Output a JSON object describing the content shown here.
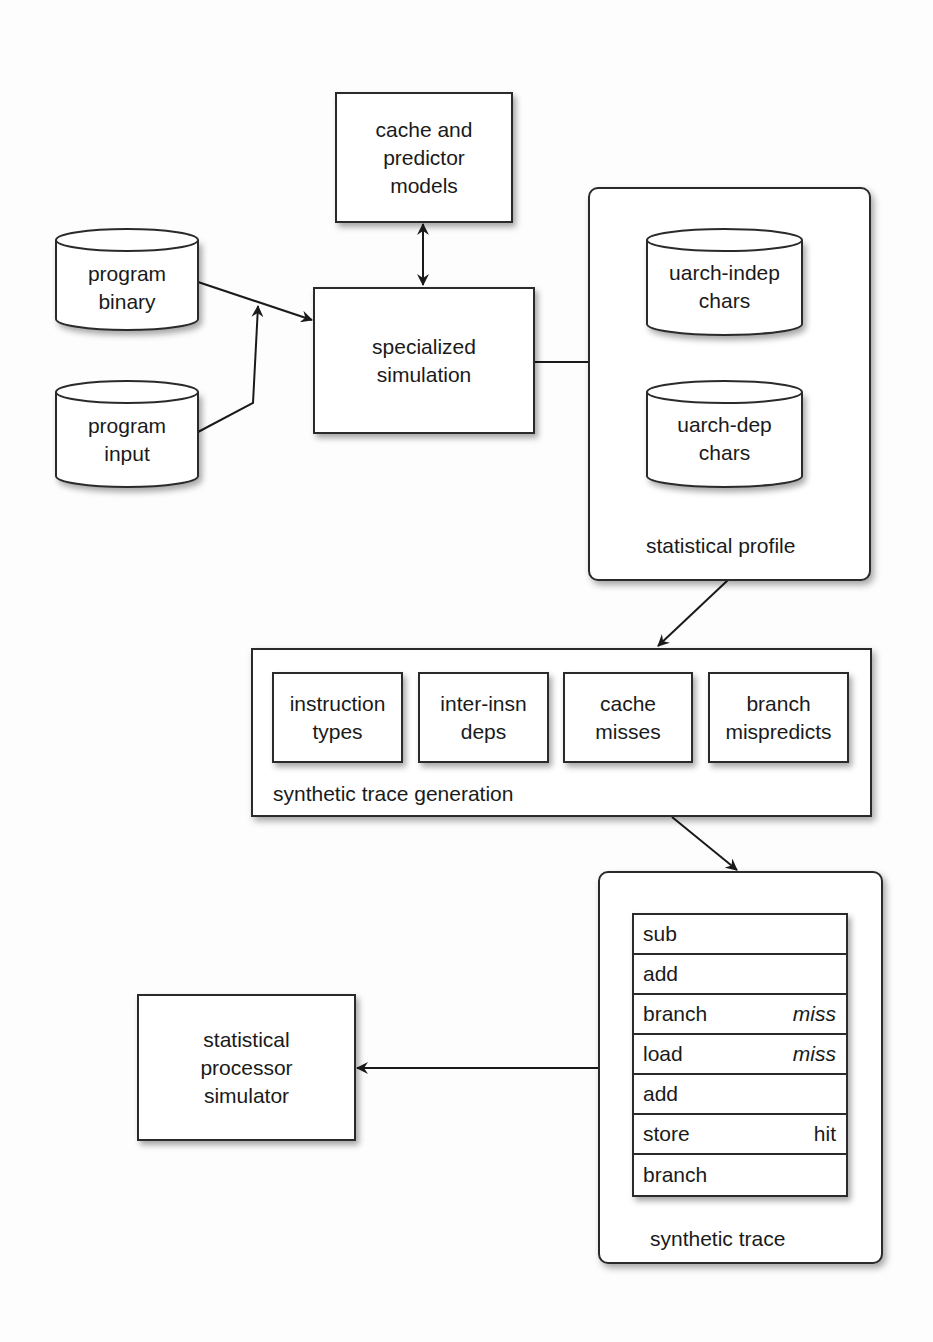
{
  "diagram": {
    "nodes": {
      "cache_predictor": {
        "label": "cache and\npredictor\nmodels"
      },
      "program_binary": {
        "label": "program\nbinary"
      },
      "program_input": {
        "label": "program\ninput"
      },
      "specialized_sim": {
        "label": "specialized\nsimulation"
      },
      "uarch_indep": {
        "label": "uarch-indep\nchars"
      },
      "uarch_dep": {
        "label": "uarch-dep\nchars"
      },
      "stat_proc_sim": {
        "label": "statistical\nprocessor\nsimulator"
      }
    },
    "groups": {
      "statistical_profile": {
        "caption": "statistical profile"
      },
      "trace_generation": {
        "caption": "synthetic trace generation",
        "components": [
          {
            "label": "instruction\ntypes"
          },
          {
            "label": "inter-insn\ndeps"
          },
          {
            "label": "cache\nmisses"
          },
          {
            "label": "branch\nmispredicts"
          }
        ]
      },
      "synthetic_trace": {
        "caption": "synthetic trace",
        "rows": [
          {
            "insn": "sub",
            "status": ""
          },
          {
            "insn": "add",
            "status": ""
          },
          {
            "insn": "branch",
            "status": "miss"
          },
          {
            "insn": "load",
            "status": "miss"
          },
          {
            "insn": "add",
            "status": ""
          },
          {
            "insn": "store",
            "status": "hit"
          },
          {
            "insn": "branch",
            "status": ""
          }
        ]
      }
    },
    "edges": [
      {
        "from": "program binary",
        "to": "specialized simulation"
      },
      {
        "from": "program input",
        "to": "specialized simulation"
      },
      {
        "from": "cache and predictor models",
        "to": "specialized simulation",
        "bidirectional": true
      },
      {
        "from": "specialized simulation",
        "to": "uarch-indep chars"
      },
      {
        "from": "specialized simulation",
        "to": "uarch-dep chars"
      },
      {
        "from": "statistical profile",
        "to": "synthetic trace generation"
      },
      {
        "from": "synthetic trace generation",
        "to": "synthetic trace"
      },
      {
        "from": "synthetic trace",
        "to": "statistical processor simulator"
      }
    ],
    "colors": {
      "stroke": "#2a2a2a",
      "fill": "#ffffff",
      "background": "#fdfdfd"
    }
  }
}
